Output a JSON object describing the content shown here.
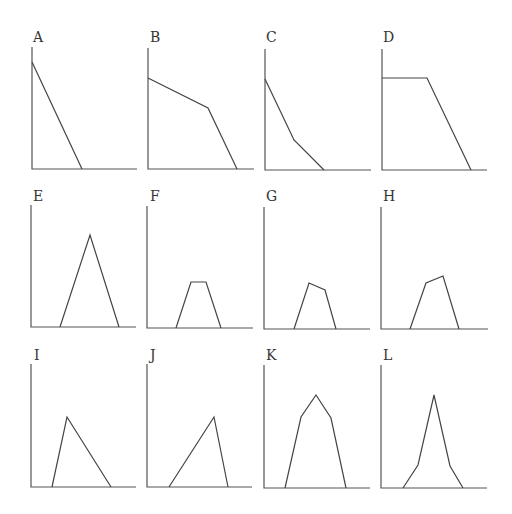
{
  "figure": {
    "layout": "3 rows x 4 columns of small line-shape panels",
    "panels": [
      {
        "label": "A",
        "label_pos": [
          33,
          42
        ],
        "origin": [
          32,
          169
        ],
        "y_top": 47,
        "x_end": 137,
        "points": [
          [
            32,
            62
          ],
          [
            82,
            169
          ]
        ]
      },
      {
        "label": "B",
        "label_pos": [
          150,
          42
        ],
        "origin": [
          148,
          169
        ],
        "y_top": 48,
        "x_end": 254,
        "points": [
          [
            148,
            78
          ],
          [
            208,
            108
          ],
          [
            237,
            169
          ]
        ]
      },
      {
        "label": "C",
        "label_pos": [
          266,
          42
        ],
        "origin": [
          265,
          170
        ],
        "y_top": 49,
        "x_end": 371,
        "points": [
          [
            265,
            79
          ],
          [
            294,
            140
          ],
          [
            324,
            170
          ]
        ]
      },
      {
        "label": "D",
        "label_pos": [
          383,
          42
        ],
        "origin": [
          382,
          170
        ],
        "y_top": 49,
        "x_end": 487,
        "points": [
          [
            382,
            78
          ],
          [
            427,
            78
          ],
          [
            471,
            170
          ]
        ]
      },
      {
        "label": "E",
        "label_pos": [
          33,
          201
        ],
        "origin": [
          31,
          327
        ],
        "y_top": 205,
        "x_end": 136,
        "points": [
          [
            60,
            327
          ],
          [
            90,
            235
          ],
          [
            119,
            327
          ]
        ]
      },
      {
        "label": "F",
        "label_pos": [
          150,
          201
        ],
        "origin": [
          147,
          328
        ],
        "y_top": 206,
        "x_end": 253,
        "points": [
          [
            176,
            328
          ],
          [
            191,
            282
          ],
          [
            206,
            282
          ],
          [
            221,
            328
          ]
        ]
      },
      {
        "label": "G",
        "label_pos": [
          266,
          201
        ],
        "origin": [
          264,
          329
        ],
        "y_top": 207,
        "x_end": 370,
        "points": [
          [
            294,
            329
          ],
          [
            309,
            283
          ],
          [
            325,
            290
          ],
          [
            336,
            329
          ]
        ]
      },
      {
        "label": "H",
        "label_pos": [
          383,
          201
        ],
        "origin": [
          381,
          329
        ],
        "y_top": 207,
        "x_end": 488,
        "points": [
          [
            410,
            329
          ],
          [
            426,
            283
          ],
          [
            443,
            276
          ],
          [
            459,
            329
          ]
        ]
      },
      {
        "label": "I",
        "label_pos": [
          34,
          360
        ],
        "origin": [
          31,
          487
        ],
        "y_top": 364,
        "x_end": 136,
        "points": [
          [
            52,
            487
          ],
          [
            67,
            417
          ],
          [
            111,
            487
          ]
        ]
      },
      {
        "label": "J",
        "label_pos": [
          150,
          360
        ],
        "origin": [
          147,
          487
        ],
        "y_top": 364,
        "x_end": 252,
        "points": [
          [
            169,
            487
          ],
          [
            214,
            417
          ],
          [
            228,
            487
          ]
        ]
      },
      {
        "label": "K",
        "label_pos": [
          266,
          360
        ],
        "origin": [
          264,
          488
        ],
        "y_top": 365,
        "x_end": 370,
        "points": [
          [
            285,
            488
          ],
          [
            301,
            417
          ],
          [
            316,
            395
          ],
          [
            331,
            418
          ],
          [
            346,
            488
          ]
        ]
      },
      {
        "label": "L",
        "label_pos": [
          383,
          360
        ],
        "origin": [
          381,
          488
        ],
        "y_top": 365,
        "x_end": 487,
        "points": [
          [
            403,
            488
          ],
          [
            418,
            465
          ],
          [
            434,
            395
          ],
          [
            450,
            466
          ],
          [
            463,
            488
          ]
        ]
      }
    ]
  }
}
